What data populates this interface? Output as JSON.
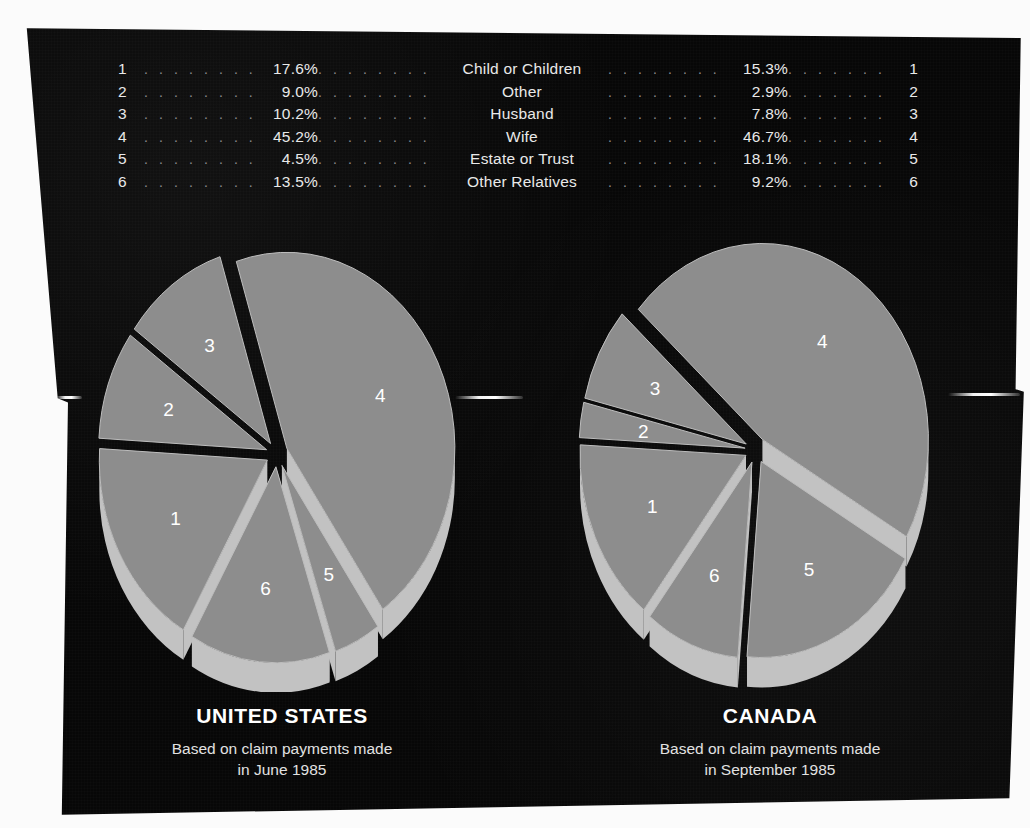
{
  "legend": {
    "left_index_header": "",
    "rows": [
      {
        "index": "1",
        "us_pct": "17.6%",
        "label": "Child  or  Children",
        "ca_pct": "15.3%",
        "index_right": "1"
      },
      {
        "index": "2",
        "us_pct": "9.0%",
        "label": "Other",
        "ca_pct": "2.9%",
        "index_right": "2"
      },
      {
        "index": "3",
        "us_pct": "10.2%",
        "label": "Husband",
        "ca_pct": "7.8%",
        "index_right": "3"
      },
      {
        "index": "4",
        "us_pct": "45.2%",
        "label": "Wife",
        "ca_pct": "46.7%",
        "index_right": "4"
      },
      {
        "index": "5",
        "us_pct": "4.5%",
        "label": "Estate or Trust",
        "ca_pct": "18.1%",
        "index_right": "5"
      },
      {
        "index": "6",
        "us_pct": "13.5%",
        "label": "Other  Relatives",
        "ca_pct": "9.2%",
        "index_right": "6"
      }
    ],
    "dot_leader": ". . . . . . . . . ."
  },
  "panels": {
    "us": {
      "country": "UNITED STATES",
      "caption_line1": "Based on claim payments made",
      "caption_line2": "in June 1985"
    },
    "ca": {
      "country": "CANADA",
      "caption_line1": "Based on claim payments made",
      "caption_line2": "in September 1985"
    }
  },
  "colors": {
    "page_background": "#070707",
    "slice_top": "#8d8d8d",
    "slice_side": "#c2c2c2",
    "slice_edge": "#bdbdbd",
    "text": "#ffffff",
    "dots": "#8e8e8e",
    "paper": "#fbfbfb"
  },
  "chart_data": [
    {
      "type": "pie",
      "title": "UNITED STATES",
      "subtitle": "Based on claim payments made in June 1985",
      "exploded": true,
      "three_d": true,
      "legend_position": "top-table",
      "categories": [
        "Child or Children",
        "Other",
        "Husband",
        "Wife",
        "Estate or Trust",
        "Other Relatives"
      ],
      "slice_numbers": [
        "1",
        "2",
        "3",
        "4",
        "5",
        "6"
      ],
      "values": [
        17.6,
        9.0,
        10.2,
        45.2,
        4.5,
        13.5
      ],
      "units": "percent"
    },
    {
      "type": "pie",
      "title": "CANADA",
      "subtitle": "Based on claim payments made in September 1985",
      "exploded": true,
      "three_d": true,
      "legend_position": "top-table",
      "categories": [
        "Child or Children",
        "Other",
        "Husband",
        "Wife",
        "Estate or Trust",
        "Other Relatives"
      ],
      "slice_numbers": [
        "1",
        "2",
        "3",
        "4",
        "5",
        "6"
      ],
      "values": [
        15.3,
        2.9,
        7.8,
        46.7,
        18.1,
        9.2
      ],
      "units": "percent"
    }
  ]
}
